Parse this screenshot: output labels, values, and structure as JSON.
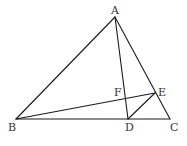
{
  "diagram": {
    "type": "geometry-figure",
    "points": {
      "A": {
        "label": "A",
        "x": 115,
        "y": 17,
        "lx": 111,
        "ly": 14
      },
      "B": {
        "label": "B",
        "x": 16,
        "y": 119,
        "lx": 8,
        "ly": 131
      },
      "C": {
        "label": "C",
        "x": 170,
        "y": 119,
        "lx": 170,
        "ly": 131
      },
      "D": {
        "label": "D",
        "x": 128,
        "y": 119,
        "lx": 125,
        "ly": 131
      },
      "E": {
        "label": "E",
        "x": 155,
        "y": 93,
        "lx": 158,
        "ly": 96
      },
      "F": {
        "label": "F",
        "x": 126,
        "y": 98,
        "lx": 114,
        "ly": 96
      }
    },
    "segments": [
      {
        "name": "AB",
        "from": "A",
        "to": "B"
      },
      {
        "name": "AC",
        "from": "A",
        "to": "C"
      },
      {
        "name": "BC",
        "from": "B",
        "to": "C"
      },
      {
        "name": "AD",
        "from": "A",
        "to": "D"
      },
      {
        "name": "BE",
        "from": "B",
        "to": "E"
      },
      {
        "name": "DE",
        "from": "D",
        "to": "E"
      }
    ],
    "colors": {
      "stroke": "#1a1a1a",
      "label": "#333333",
      "background": "#ffffff"
    }
  }
}
